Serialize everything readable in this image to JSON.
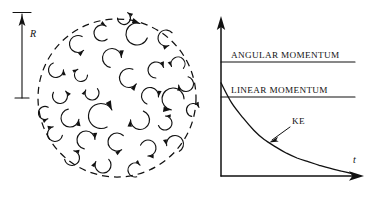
{
  "figure": {
    "background_color": "#ffffff",
    "ink_color": "#111111"
  },
  "left_panel": {
    "name": "turbulent-region",
    "boundary": {
      "shape": "circle",
      "style": "dashed",
      "center_x": 117,
      "center_y": 98,
      "radius": 79
    },
    "radius_label": "R",
    "dimension_line": {
      "x": 22,
      "y_top": 13,
      "y_bottom": 98,
      "arrow": "up",
      "cap_top": true,
      "cap_bottom": true
    },
    "eddies": [
      {
        "cx": 78,
        "cy": 44,
        "r": 8.5,
        "rot": 20,
        "dir": "ccw",
        "span": 250
      },
      {
        "cx": 102,
        "cy": 33,
        "r": 8.0,
        "rot": 150,
        "dir": "cw",
        "span": 250
      },
      {
        "cx": 137,
        "cy": 34,
        "r": 11.0,
        "rot": 120,
        "dir": "cw",
        "span": 265
      },
      {
        "cx": 166,
        "cy": 38,
        "r": 8.0,
        "rot": 40,
        "dir": "ccw",
        "span": 250
      },
      {
        "cx": 112,
        "cy": 58,
        "r": 9.5,
        "rot": 200,
        "dir": "cw",
        "span": 255
      },
      {
        "cx": 56,
        "cy": 70,
        "r": 7.5,
        "rot": 330,
        "dir": "ccw",
        "span": 250
      },
      {
        "cx": 81,
        "cy": 75,
        "r": 6.5,
        "rot": 100,
        "dir": "cw",
        "span": 240
      },
      {
        "cx": 129,
        "cy": 78,
        "r": 9.5,
        "rot": 15,
        "dir": "ccw",
        "span": 255
      },
      {
        "cx": 156,
        "cy": 70,
        "r": 8.0,
        "rot": 190,
        "dir": "cw",
        "span": 250
      },
      {
        "cx": 178,
        "cy": 64,
        "r": 7.0,
        "rot": 120,
        "dir": "ccw",
        "span": 240
      },
      {
        "cx": 186,
        "cy": 84,
        "r": 7.5,
        "rot": 25,
        "dir": "cw",
        "span": 245
      },
      {
        "cx": 60,
        "cy": 96,
        "r": 7.5,
        "rot": 290,
        "dir": "ccw",
        "span": 250
      },
      {
        "cx": 92,
        "cy": 93,
        "r": 7.0,
        "rot": 60,
        "dir": "cw",
        "span": 245
      },
      {
        "cx": 150,
        "cy": 96,
        "r": 8.5,
        "rot": 210,
        "dir": "cw",
        "span": 255
      },
      {
        "cx": 173,
        "cy": 99,
        "r": 11.0,
        "rot": 80,
        "dir": "ccw",
        "span": 260
      },
      {
        "cx": 70,
        "cy": 118,
        "r": 9.0,
        "rot": 340,
        "dir": "ccw",
        "span": 250
      },
      {
        "cx": 101,
        "cy": 116,
        "r": 12.5,
        "rot": 160,
        "dir": "cw",
        "span": 270
      },
      {
        "cx": 140,
        "cy": 120,
        "r": 9.5,
        "rot": 30,
        "dir": "cw",
        "span": 250
      },
      {
        "cx": 165,
        "cy": 123,
        "r": 7.0,
        "rot": 240,
        "dir": "ccw",
        "span": 245
      },
      {
        "cx": 55,
        "cy": 134,
        "r": 7.5,
        "rot": 110,
        "dir": "cw",
        "span": 245
      },
      {
        "cx": 86,
        "cy": 140,
        "r": 9.0,
        "rot": 200,
        "dir": "cw",
        "span": 255
      },
      {
        "cx": 117,
        "cy": 142,
        "r": 9.0,
        "rot": 35,
        "dir": "ccw",
        "span": 255
      },
      {
        "cx": 148,
        "cy": 148,
        "r": 8.0,
        "rot": 300,
        "dir": "cw",
        "span": 250
      },
      {
        "cx": 175,
        "cy": 144,
        "r": 8.5,
        "rot": 140,
        "dir": "ccw",
        "span": 250
      },
      {
        "cx": 72,
        "cy": 158,
        "r": 7.5,
        "rot": 250,
        "dir": "ccw",
        "span": 245
      },
      {
        "cx": 103,
        "cy": 165,
        "r": 8.0,
        "rot": 55,
        "dir": "cw",
        "span": 250
      },
      {
        "cx": 135,
        "cy": 170,
        "r": 7.0,
        "rot": 175,
        "dir": "cw",
        "span": 240
      },
      {
        "cx": 45,
        "cy": 113,
        "r": 6.5,
        "rot": 20,
        "dir": "ccw",
        "span": 235
      },
      {
        "cx": 193,
        "cy": 110,
        "r": 6.5,
        "rot": 200,
        "dir": "cw",
        "span": 235
      },
      {
        "cx": 124,
        "cy": 18,
        "r": 6.5,
        "rot": 260,
        "dir": "ccw",
        "span": 235
      }
    ]
  },
  "chart_data": {
    "type": "line",
    "title": "",
    "xlabel": "t",
    "ylabel": "",
    "xlim": [
      0,
      1
    ],
    "ylim": [
      0,
      1
    ],
    "grid": false,
    "legend": "inline-annotations",
    "series": [
      {
        "name": "ANGULAR MOMENTUM",
        "style": "constant",
        "value": 0.78,
        "label": "ANGULAR MOMENTUM",
        "label_position": "above-line-left"
      },
      {
        "name": "LINEAR MOMENTUM",
        "style": "constant",
        "value": 0.52,
        "label": "LINEAR MOMENTUM",
        "label_position": "above-line-left"
      },
      {
        "name": "KE",
        "style": "exponential-decay",
        "label": "KE",
        "y0": 0.66,
        "decay": "asymptotic to t-axis",
        "points": [
          {
            "t": 0.0,
            "y": 0.66
          },
          {
            "t": 0.08,
            "y": 0.52
          },
          {
            "t": 0.17,
            "y": 0.41
          },
          {
            "t": 0.25,
            "y": 0.325
          },
          {
            "t": 0.33,
            "y": 0.258
          },
          {
            "t": 0.42,
            "y": 0.205
          },
          {
            "t": 0.5,
            "y": 0.162
          },
          {
            "t": 0.58,
            "y": 0.128
          },
          {
            "t": 0.67,
            "y": 0.1
          },
          {
            "t": 0.75,
            "y": 0.076
          },
          {
            "t": 0.83,
            "y": 0.055
          },
          {
            "t": 0.92,
            "y": 0.035
          },
          {
            "t": 1.0,
            "y": 0.018
          }
        ]
      }
    ],
    "axes": {
      "x_axis_arrow": true,
      "y_axis_arrow": true,
      "origin_x": 221,
      "origin_y": 176,
      "x_end": 364,
      "y_end": 17
    },
    "annotations": [
      {
        "text": "KE",
        "x": 297,
        "y": 120,
        "leader": "arrow to curve"
      },
      {
        "text": "t",
        "x": 357,
        "y": 163,
        "italic": true
      }
    ]
  }
}
